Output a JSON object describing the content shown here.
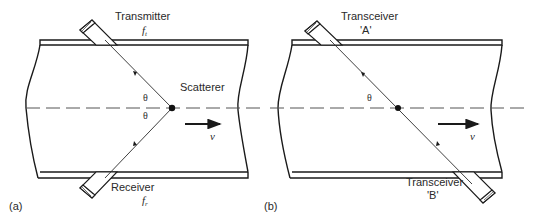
{
  "figure": {
    "panels": [
      {
        "id": "a",
        "caption": "(a)",
        "top_transducer": {
          "label": "Transmitter",
          "symbol": "f",
          "subscript": "t"
        },
        "bottom_transducer": {
          "label": "Receiver",
          "symbol": "f",
          "subscript": "r"
        },
        "target_label": "Scatterer",
        "angle_symbol_top": "θ",
        "angle_symbol_bottom": "θ",
        "velocity_symbol": "v"
      },
      {
        "id": "b",
        "caption": "(b)",
        "top_transducer": {
          "label": "Transceiver",
          "symbol": "'A'"
        },
        "bottom_transducer": {
          "label": "Transceiver",
          "symbol": "'B'"
        },
        "angle_symbol_top": "θ",
        "velocity_symbol": "v"
      }
    ]
  }
}
